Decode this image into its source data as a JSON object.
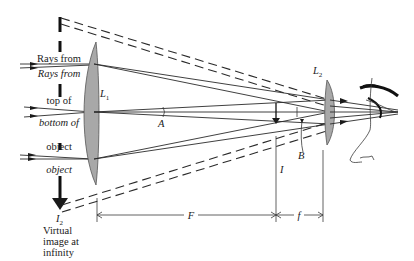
{
  "diagram": {
    "labels": {
      "rays_top": [
        "Rays from",
        "top of",
        "object"
      ],
      "rays_bottom": [
        "Rays from",
        "bottom of",
        "object"
      ],
      "lens1": "L",
      "lens1_sub": "1",
      "lens2": "L",
      "lens2_sub": "2",
      "image2": "I",
      "image2_sub": "2",
      "image2_caption": [
        "Virtual",
        "image at",
        "infinity"
      ],
      "angle_a": "A",
      "angle_b": "B",
      "intermediate_image": "I",
      "focal_long": "F",
      "focal_short": "f"
    },
    "colors": {
      "ink": "#1a1a1a",
      "lens_fill": "#a8a8a8",
      "background": "#ffffff"
    }
  }
}
